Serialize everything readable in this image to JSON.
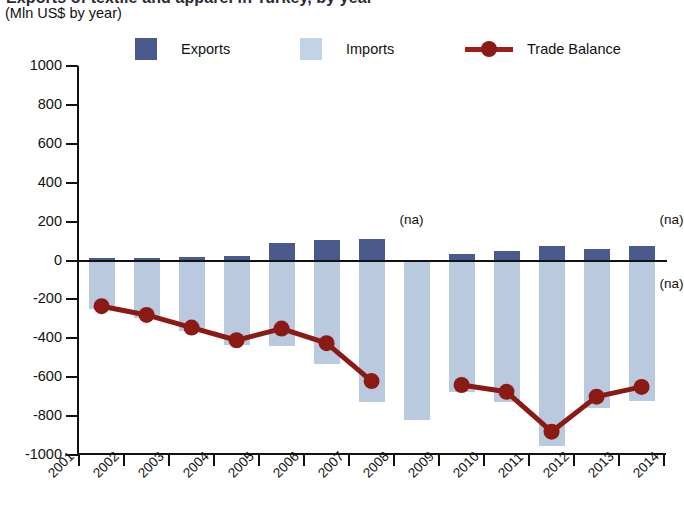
{
  "title": {
    "main": "Exports of textile and apparel in Turkey, by year",
    "subtitle": "(Mln US$ by year)"
  },
  "legend": {
    "position": "top",
    "items": [
      {
        "key": "exports",
        "label": "Exports",
        "color": "#4a5a8c",
        "marker": "square"
      },
      {
        "key": "imports",
        "label": "Imports",
        "color": "#c3d3e6",
        "marker": "square"
      },
      {
        "key": "balance",
        "label": "Trade Balance",
        "color": "#8c1a14",
        "marker": "line-dot"
      }
    ]
  },
  "annotations": [
    {
      "text": "(na)",
      "x_year": "2008",
      "y_value": 200,
      "side": "top"
    },
    {
      "text": "(na)",
      "x_year": "2014",
      "y_value": 200,
      "side": "top"
    },
    {
      "text": "(na)",
      "x_year": "2014",
      "y_value": -130,
      "side": "bottom"
    }
  ],
  "chart_data": {
    "type": "bar",
    "title": "Exports of textile and apparel in Turkey, by year",
    "subtitle": "(Mln US$ by year)",
    "xlabel": "",
    "ylabel": "Mln US$",
    "ylim": [
      -1000,
      1000
    ],
    "yticks": [
      1000,
      800,
      600,
      400,
      200,
      0,
      -200,
      -400,
      -600,
      -800,
      -1000
    ],
    "ytick_labels": [
      "1000",
      "800",
      "600",
      "400",
      "200",
      "0",
      "-200",
      "-400",
      "-600",
      "-800",
      "-1000"
    ],
    "grid": false,
    "categories": [
      "2001",
      "2002",
      "2003",
      "2004",
      "2005",
      "2006",
      "2007",
      "2008",
      "2009",
      "2010",
      "2011",
      "2012",
      "2013",
      "2014"
    ],
    "series": [
      {
        "name": "Exports",
        "type": "bar",
        "color": "#4a5a8c",
        "values": [
          15,
          15,
          18,
          22,
          90,
          105,
          110,
          null,
          35,
          50,
          75,
          60,
          72,
          null
        ]
      },
      {
        "name": "Imports",
        "type": "bar",
        "color": "#c3d3e6",
        "note": "plotted as negative magnitudes below the zero line",
        "values": [
          -250,
          -295,
          -365,
          -435,
          -440,
          -530,
          -730,
          -820,
          -675,
          -725,
          -955,
          -760,
          -720,
          null
        ]
      },
      {
        "name": "Trade Balance",
        "type": "line",
        "color": "#8c1a14",
        "values": [
          -235,
          -280,
          -345,
          -410,
          -350,
          -425,
          -620,
          null,
          -640,
          -675,
          -880,
          -700,
          -650,
          null
        ]
      }
    ]
  }
}
